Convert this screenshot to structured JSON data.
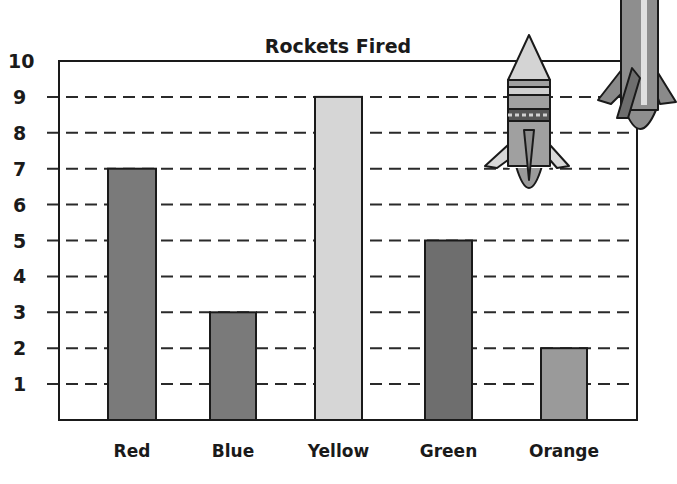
{
  "chart_data": {
    "type": "bar",
    "title": "Rockets Fired",
    "xlabel": "",
    "ylabel": "",
    "categories": [
      "Red",
      "Blue",
      "Yellow",
      "Green",
      "Orange"
    ],
    "values": [
      7,
      3,
      9,
      5,
      2
    ],
    "bar_colors": [
      "#7a7a7a",
      "#7a7a7a",
      "#d6d6d6",
      "#6e6e6e",
      "#9a9a9a"
    ],
    "ylim": [
      0,
      10
    ],
    "yticks": [
      1,
      2,
      3,
      4,
      5,
      6,
      7,
      8,
      9,
      10
    ],
    "grid": "dashed horizontal",
    "legend": null,
    "decorations": [
      "rocket-illustration",
      "rocket-illustration"
    ]
  }
}
